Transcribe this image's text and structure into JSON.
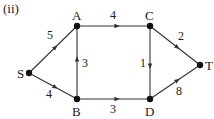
{
  "figure_label": "(ii)",
  "nodes": [
    {
      "id": "S",
      "label": "S",
      "x": 29,
      "y": 73
    },
    {
      "id": "A",
      "label": "A",
      "x": 77,
      "y": 26
    },
    {
      "id": "B",
      "label": "B",
      "x": 77,
      "y": 99
    },
    {
      "id": "C",
      "label": "C",
      "x": 150,
      "y": 26
    },
    {
      "id": "D",
      "label": "D",
      "x": 150,
      "y": 99
    },
    {
      "id": "T",
      "label": "T",
      "x": 200,
      "y": 65
    }
  ],
  "edges": [
    {
      "from": "S",
      "to": "A",
      "weight": "5"
    },
    {
      "from": "S",
      "to": "B",
      "weight": "4"
    },
    {
      "from": "A",
      "to": "C",
      "weight": "4"
    },
    {
      "from": "B",
      "to": "A",
      "weight": "3"
    },
    {
      "from": "B",
      "to": "D",
      "weight": "3"
    },
    {
      "from": "C",
      "to": "D",
      "weight": "1"
    },
    {
      "from": "C",
      "to": "T",
      "weight": "2"
    },
    {
      "from": "D",
      "to": "T",
      "weight": "8"
    }
  ],
  "colors": {
    "stroke": "#333333",
    "node": "#111111"
  }
}
